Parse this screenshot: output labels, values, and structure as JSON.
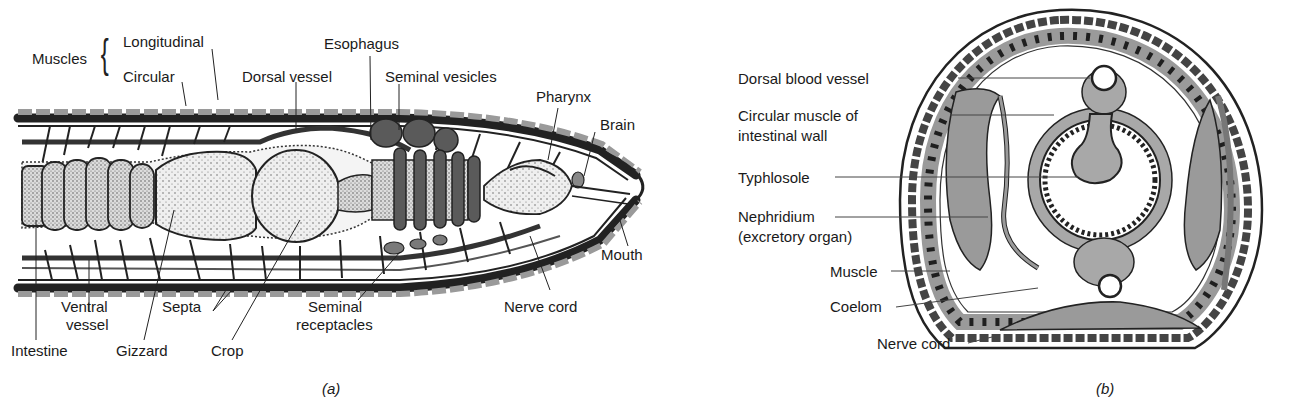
{
  "figure_a": {
    "caption": "(a)",
    "title": "Longitudinal section of earthworm anterior",
    "labels": {
      "muscles": "Muscles",
      "longitudinal": "Longitudinal",
      "circular": "Circular",
      "esophagus": "Esophagus",
      "dorsal_vessel": "Dorsal vessel",
      "seminal_vesicles": "Seminal vesicles",
      "pharynx": "Pharynx",
      "brain": "Brain",
      "mouth": "Mouth",
      "ventral_vessel_1": "Ventral",
      "ventral_vessel_2": "vessel",
      "septa": "Septa",
      "seminal_receptacles_1": "Seminal",
      "seminal_receptacles_2": "receptacles",
      "nerve_cord": "Nerve cord",
      "intestine": "Intestine",
      "gizzard": "Gizzard",
      "crop": "Crop"
    }
  },
  "figure_b": {
    "caption": "(b)",
    "title": "Cross section of earthworm",
    "labels": {
      "dorsal_blood_vessel": "Dorsal blood vessel",
      "circular_muscle_1": "Circular muscle of",
      "circular_muscle_2": "intestinal wall",
      "typhlosole": "Typhlosole",
      "nephridium_1": "Nephridium",
      "nephridium_2": "(excretory organ)",
      "muscle": "Muscle",
      "coelom": "Coelom",
      "nerve_cord": "Nerve cord"
    }
  },
  "colors": {
    "ink": "#1a1a1a",
    "organ_gray": "#8a8a8a",
    "stipple_fill": "#e6e6e6",
    "dark_gray": "#5a5a5a",
    "light_band": "#d9d9d9"
  }
}
